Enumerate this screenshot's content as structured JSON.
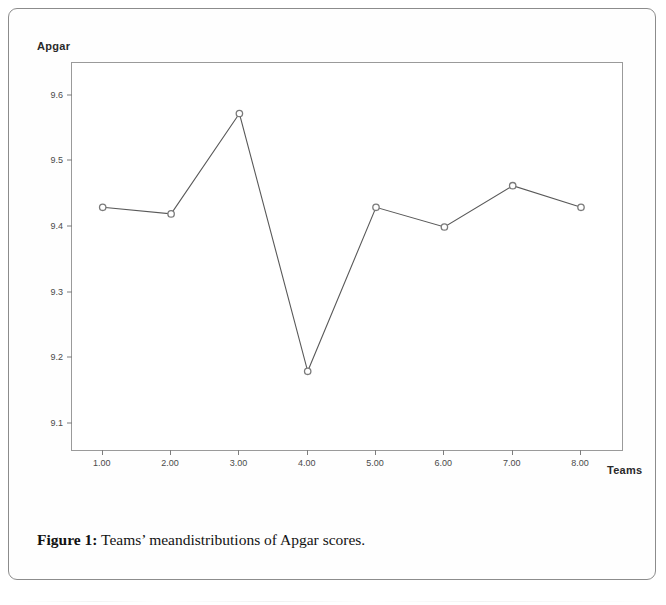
{
  "page": {
    "caption_prefix": "Figure 1:",
    "caption_text": " Teams’ meandistributions of Apgar scores."
  },
  "chart_data": {
    "type": "line",
    "title": "",
    "xlabel": "Teams",
    "ylabel": "Apgar",
    "categories": [
      "1.00",
      "2.00",
      "3.00",
      "4.00",
      "5.00",
      "6.00",
      "7.00",
      "8.00"
    ],
    "x": [
      1,
      2,
      3,
      4,
      5,
      6,
      7,
      8
    ],
    "values": [
      9.43,
      9.42,
      9.573,
      9.18,
      9.43,
      9.4,
      9.463,
      9.43
    ],
    "ylim": [
      9.06,
      9.65
    ],
    "xlim": [
      0.55,
      8.6
    ],
    "yticks": [
      "9.6",
      "9.5",
      "9.4",
      "9.3",
      "9.2",
      "9.1"
    ],
    "ytick_values": [
      9.6,
      9.5,
      9.4,
      9.3,
      9.2,
      9.1
    ],
    "grid": false,
    "legend": "none",
    "marker": "open-circle",
    "line_color": "#595959",
    "marker_color": "#7a7a7a",
    "frame_color": "#9a9a9a"
  }
}
